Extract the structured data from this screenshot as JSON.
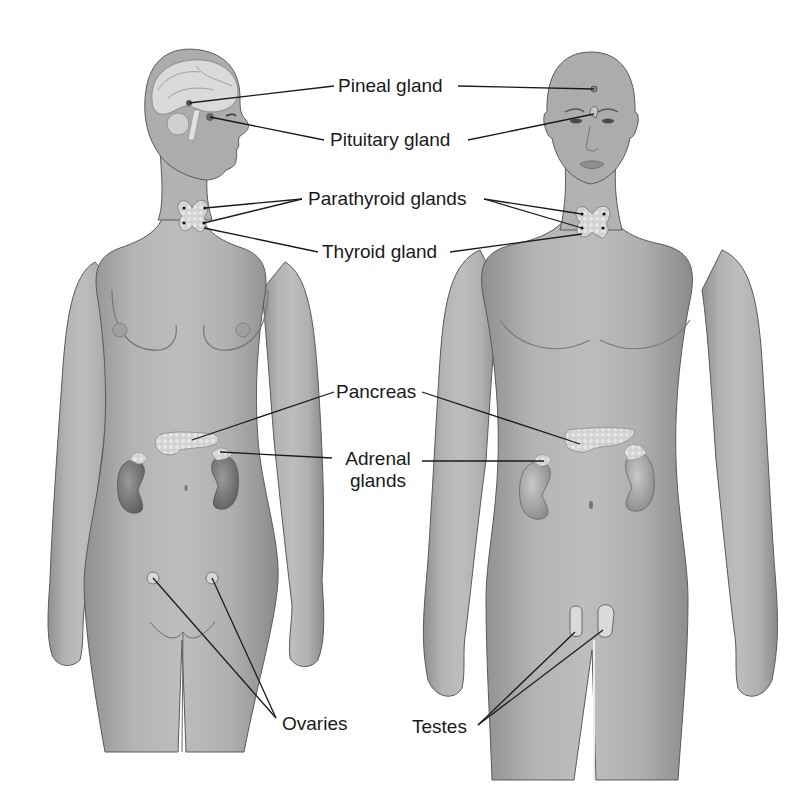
{
  "figure": {
    "colors": {
      "background": "#ffffff",
      "skin": "#a9a9a9",
      "skin_light": "#c4c4c4",
      "skin_dark": "#7d7d7d",
      "outline": "#5a5a5a",
      "gland": "#d6d6d6",
      "kidney": "#6e6e6e",
      "leader_line": "#1a1a1a",
      "label_text": "#1a1a1a"
    },
    "figures": [
      {
        "id": "female",
        "label": "Female figure",
        "position": "left"
      },
      {
        "id": "male",
        "label": "Male figure",
        "position": "right"
      }
    ],
    "labels": {
      "pineal": "Pineal gland",
      "pituitary": "Pituitary gland",
      "parathyroid": "Parathyroid glands",
      "thyroid": "Thyroid gland",
      "pancreas": "Pancreas",
      "adrenal_line1": "Adrenal",
      "adrenal_line2": "glands",
      "ovaries": "Ovaries",
      "testes": "Testes"
    }
  }
}
